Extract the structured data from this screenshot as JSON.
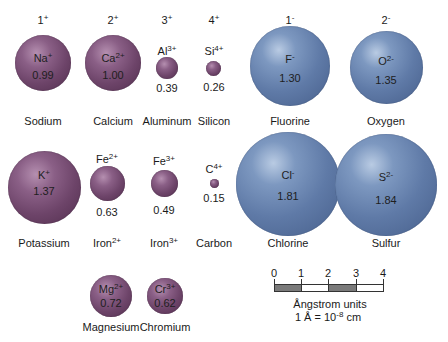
{
  "figure": {
    "type": "ionic radii comparison diagram",
    "charge_headers": [
      {
        "label": "1",
        "sign": "+",
        "x": 43
      },
      {
        "label": "2",
        "sign": "+",
        "x": 113
      },
      {
        "label": "3",
        "sign": "+",
        "x": 167
      },
      {
        "label": "4",
        "sign": "+",
        "x": 214
      },
      {
        "label": "1",
        "sign": "-",
        "x": 290
      },
      {
        "label": "2",
        "sign": "-",
        "x": 386
      }
    ],
    "ions": [
      {
        "symbol": "Na",
        "charge": "+",
        "radius": "0.99",
        "name": "Sodium",
        "name_sup": "",
        "type": "cation"
      },
      {
        "symbol": "Ca",
        "charge": "2+",
        "radius": "1.00",
        "name": "Calcium",
        "name_sup": "",
        "type": "cation"
      },
      {
        "symbol": "Al",
        "charge": "3+",
        "radius": "0.39",
        "name": "Aluminum",
        "name_sup": "",
        "type": "cation"
      },
      {
        "symbol": "Si",
        "charge": "4+",
        "radius": "0.26",
        "name": "Silicon",
        "name_sup": "",
        "type": "cation"
      },
      {
        "symbol": "F",
        "charge": "-",
        "radius": "1.30",
        "name": "Fluorine",
        "name_sup": "",
        "type": "anion"
      },
      {
        "symbol": "O",
        "charge": "2-",
        "radius": "1.35",
        "name": "Oxygen",
        "name_sup": "",
        "type": "anion"
      },
      {
        "symbol": "K",
        "charge": "+",
        "radius": "1.37",
        "name": "Potassium",
        "name_sup": "",
        "type": "cation"
      },
      {
        "symbol": "Fe",
        "charge": "2+",
        "radius": "0.63",
        "name": "Iron",
        "name_sup": "2+",
        "type": "cation"
      },
      {
        "symbol": "Fe",
        "charge": "3+",
        "radius": "0.49",
        "name": "Iron",
        "name_sup": "3+",
        "type": "cation"
      },
      {
        "symbol": "C",
        "charge": "4+",
        "radius": "0.15",
        "name": "Carbon",
        "name_sup": "",
        "type": "cation"
      },
      {
        "symbol": "Cl",
        "charge": "-",
        "radius": "1.81",
        "name": "Chlorine",
        "name_sup": "",
        "type": "anion"
      },
      {
        "symbol": "S",
        "charge": "2-",
        "radius": "1.84",
        "name": "Sulfur",
        "name_sup": "",
        "type": "anion"
      },
      {
        "symbol": "Mg",
        "charge": "2+",
        "radius": "0.72",
        "name": "Magnesium",
        "name_sup": "",
        "type": "cation"
      },
      {
        "symbol": "Cr",
        "charge": "3+",
        "radius": "0.62",
        "name": "Chromium",
        "name_sup": "",
        "type": "cation"
      }
    ],
    "scale_bar": {
      "ticks": [
        "0",
        "1",
        "2",
        "3",
        "4"
      ],
      "unit_label": "Ångstrom units",
      "conversion_prefix": "1 Å = 10",
      "conversion_exp": "-8",
      "conversion_suffix": " cm"
    },
    "colors": {
      "cation": "#6d4469",
      "anion": "#5f7aa7",
      "scale_dark": "#7a7a7a",
      "scale_light": "#ffffff"
    }
  }
}
